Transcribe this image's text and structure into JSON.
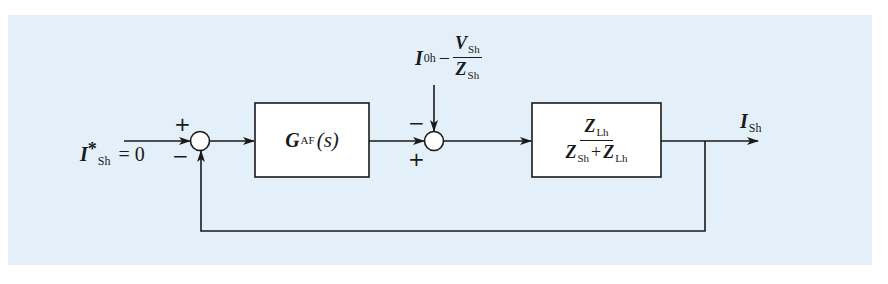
{
  "diagram": {
    "type": "control-block-diagram",
    "background_color": "#e3eff9",
    "line_color": "#1a1a1a",
    "input": {
      "symbol": "I",
      "superscript": "*",
      "subscript": "Sh",
      "value_text": "= 0"
    },
    "summing_junction_1": {
      "top_sign": "+",
      "bottom_sign": "−"
    },
    "block_1": {
      "symbol": "G",
      "subscript": "AF",
      "argument": "(s)"
    },
    "disturbance": {
      "term1_symbol": "I",
      "term1_subscript": "0h",
      "operator": "−",
      "numerator_symbol": "V",
      "numerator_subscript": "Sh",
      "denominator_symbol": "Z",
      "denominator_subscript": "Sh"
    },
    "summing_junction_2": {
      "top_sign": "−",
      "bottom_sign": "+"
    },
    "block_2": {
      "numerator_symbol": "Z",
      "numerator_subscript": "Lh",
      "denominator_term1_symbol": "Z",
      "denominator_term1_subscript": "Sh",
      "denominator_operator": "+",
      "denominator_term2_symbol": "Z",
      "denominator_term2_subscript": "Lh"
    },
    "output": {
      "symbol": "I",
      "subscript": "Sh"
    }
  }
}
